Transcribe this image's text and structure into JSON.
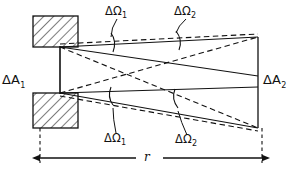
{
  "figure": {
    "type": "physics-optics-diagram",
    "background_color": "#ffffff",
    "line_color": "#111111",
    "hatch_color": "#111111"
  },
  "labels": {
    "area_left": "ΔA",
    "area_left_sub": "1",
    "area_right": "ΔA",
    "area_right_sub": "2",
    "omega_top_left": "ΔΩ",
    "omega_top_left_sub": "1",
    "omega_top_right": "ΔΩ",
    "omega_top_right_sub": "2",
    "omega_bottom_left": "ΔΩ",
    "omega_bottom_left_sub": "1",
    "omega_bottom_right": "ΔΩ",
    "omega_bottom_right_sub": "2",
    "distance": "r"
  },
  "geometry": {
    "rect_top": {
      "x": 33,
      "y": 16,
      "width": 45,
      "height": 31
    },
    "rect_bottom": {
      "x": 33,
      "y": 93,
      "width": 45,
      "height": 35
    },
    "left_aperture_line": {
      "x": 60,
      "y1": 47,
      "y2": 93
    },
    "right_aperture_line": {
      "x": 258,
      "y1": 37,
      "y2": 128
    },
    "apex_top": {
      "x": 60,
      "y": 47
    },
    "apex_bottom": {
      "x": 60,
      "y": 93
    },
    "dimension_line": {
      "y": 158,
      "x1": 40,
      "x2": 262
    },
    "extension_left": {
      "x": 40,
      "y1": 128,
      "y2": 162
    },
    "extension_right": {
      "x": 262,
      "y1": 128,
      "y2": 162
    }
  }
}
